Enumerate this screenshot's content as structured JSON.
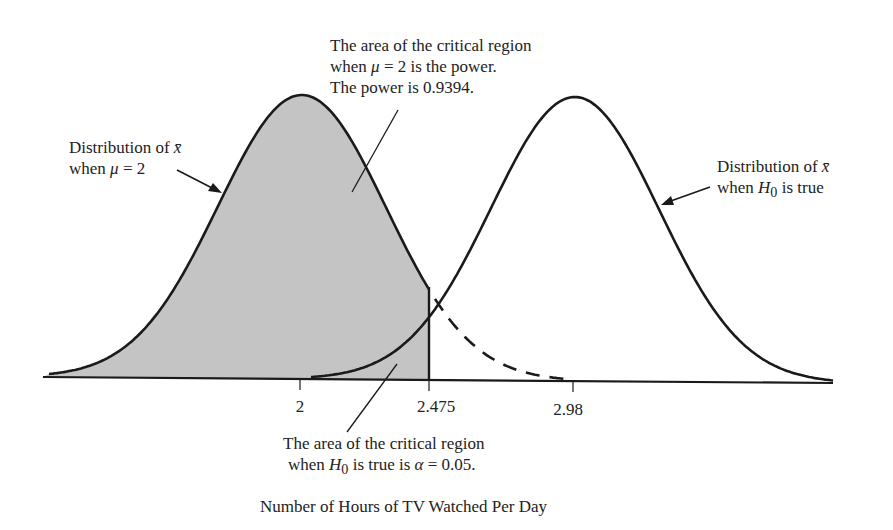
{
  "annotations": {
    "power_region": {
      "line1": "The area of the critical region",
      "line2_pre": "when ",
      "line2_sym": "μ",
      "line2_post": " = 2 is the power.",
      "line3": "The power is 0.9394."
    },
    "alt_distribution": {
      "line1_pre": "Distribution of ",
      "line1_sym": "x̄",
      "line2_pre": "when ",
      "line2_sym": "μ",
      "line2_post": " = 2"
    },
    "null_distribution": {
      "line1_pre": "Distribution of ",
      "line1_sym": "x̄",
      "line2_pre": "when ",
      "line2_sym": "H",
      "line2_sub": "0",
      "line2_post": " is true"
    },
    "alpha_region": {
      "line1": "The area of the critical region",
      "line2_pre": "when ",
      "line2_sym": "H",
      "line2_sub": "0",
      "line2_mid": " is true is ",
      "line2_alpha": "α",
      "line2_post": " = 0.05."
    }
  },
  "axis": {
    "xlabel": "Number of Hours of TV Watched Per Day",
    "ticks": [
      {
        "label": "2",
        "value": 2
      },
      {
        "label": "2.475",
        "value": 2.475
      },
      {
        "label": "2.98",
        "value": 2.98
      }
    ]
  },
  "colors": {
    "shade": "#c4c4c4",
    "stroke": "#1a1a1a"
  },
  "chart_data": {
    "type": "area",
    "title": "",
    "xlabel": "Number of Hours of TV Watched Per Day",
    "ylabel": "",
    "series": [
      {
        "name": "Distribution of x̄ when μ = 2",
        "mean": 2,
        "style": "solid until 2.475, dashed after; shaded left of 2.475"
      },
      {
        "name": "Distribution of x̄ when H0 is true",
        "mean": 2.98,
        "style": "solid"
      }
    ],
    "critical_value": 2.475,
    "alpha": 0.05,
    "power": 0.9394,
    "x_ticks": [
      2,
      2.475,
      2.98
    ]
  }
}
